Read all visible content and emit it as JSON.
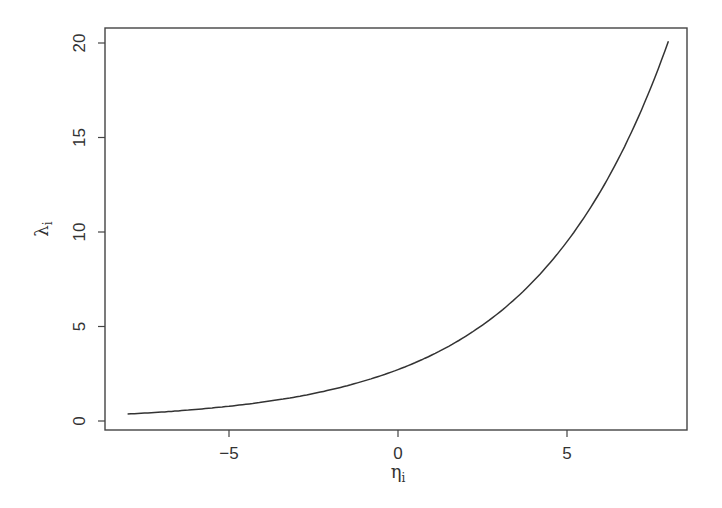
{
  "chart_data": {
    "type": "line",
    "title": "",
    "xlabel": "η",
    "xlabel_subscript": "i",
    "ylabel": "λ",
    "ylabel_subscript": "i",
    "xlim": [
      -9.7,
      8.2
    ],
    "ylim": [
      -0.5,
      20.8
    ],
    "grid": false,
    "legend": null,
    "x_ticks": [
      -5,
      0,
      5
    ],
    "x_tick_labels": [
      "−5",
      "0",
      "5"
    ],
    "y_ticks": [
      0,
      5,
      10,
      15,
      20
    ],
    "y_tick_labels": [
      "0",
      "5",
      "10",
      "15",
      "20"
    ],
    "series": [
      {
        "name": "λ = exp(1 + η/4)",
        "color": "#333333",
        "x": [
          -8,
          -7,
          -6,
          -5,
          -4,
          -3,
          -2,
          -1,
          0,
          1,
          2,
          3,
          4,
          5,
          6,
          7,
          8
        ],
        "values": [
          0.37,
          0.47,
          0.61,
          0.78,
          1.0,
          1.28,
          1.65,
          2.12,
          2.72,
          3.49,
          4.48,
          5.75,
          7.39,
          9.49,
          12.18,
          15.64,
          20.09
        ]
      }
    ]
  }
}
